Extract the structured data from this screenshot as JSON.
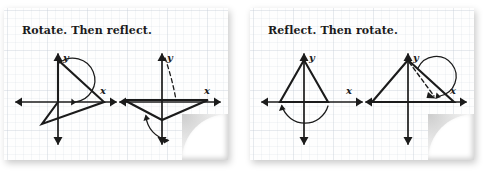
{
  "background": "#ffffff",
  "ink_color": "#1b1b1b",
  "grid_color": "#96a5b9",
  "cards": [
    {
      "id": "card-rotate-then-reflect",
      "caption": "Rotate. Then reflect.",
      "x": 4,
      "y": 8,
      "w": 224,
      "h": 152,
      "figures": [
        {
          "id": "figure-rotate-step-1",
          "name": "rotate-step-1-diagram",
          "x_axis_label": "x",
          "y_axis_label": "y",
          "shape": "triangle",
          "annotation": "270-degree-rotation-arc",
          "dashed_line": false
        },
        {
          "id": "figure-rotate-step-2",
          "name": "rotate-step-2-diagram",
          "x_axis_label": "x",
          "y_axis_label": "y",
          "shape": "triangle-reflected",
          "annotation": "reflection-arc",
          "dashed_line": true
        }
      ]
    },
    {
      "id": "card-reflect-then-rotate",
      "caption": "Reflect. Then rotate.",
      "x": 250,
      "y": 8,
      "w": 224,
      "h": 152,
      "figures": [
        {
          "id": "figure-reflect-step-1",
          "name": "reflect-step-1-diagram",
          "x_axis_label": "x",
          "y_axis_label": "y",
          "shape": "isosceles-triangle",
          "annotation": "180-degree-rotation-arc",
          "dashed_line": false
        },
        {
          "id": "figure-reflect-step-2",
          "name": "reflect-step-2-diagram",
          "x_axis_label": "x",
          "y_axis_label": "y",
          "shape": "triangle-rotated",
          "annotation": "rotation-arc",
          "dashed_line": true
        }
      ]
    }
  ]
}
